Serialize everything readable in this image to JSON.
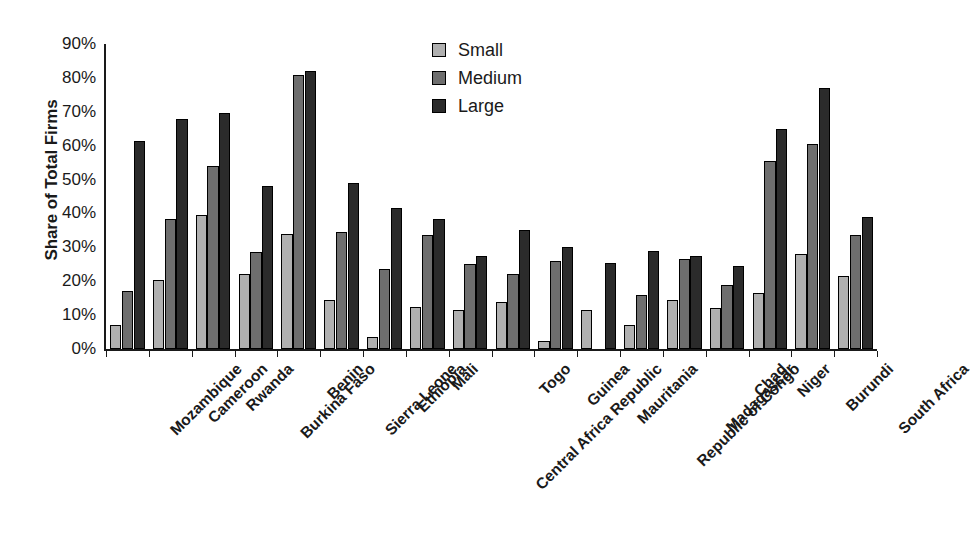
{
  "chart_data": {
    "type": "bar",
    "title": "",
    "subtitle": "",
    "xlabel": "",
    "ylabel": "Share of Total Firms",
    "ylim": [
      0,
      90
    ],
    "ytick_step": 10,
    "ytick_labels": [
      "0%",
      "10%",
      "20%",
      "30%",
      "40%",
      "50%",
      "60%",
      "70%",
      "80%",
      "90%"
    ],
    "ytick_values": [
      0,
      10,
      20,
      30,
      40,
      50,
      60,
      70,
      80,
      90
    ],
    "grid": false,
    "legend_position": "top-center",
    "categories": [
      "Mozambique",
      "Cameroon",
      "Rwanda",
      "Burkina Faso",
      "Benin",
      "Sierra Leone",
      "Ethiopia",
      "Mali",
      "Central Africa Republic",
      "Togo",
      "Guinea",
      "Mauritania",
      "Republic of Congo",
      "Madagascar",
      "Chad",
      "Niger",
      "Burundi",
      "South Africa"
    ],
    "series": [
      {
        "name": "Small",
        "color": "#b0b0b0",
        "values": [
          7,
          20.5,
          39.5,
          22,
          34,
          14.5,
          3.5,
          12.5,
          11.5,
          14,
          2.5,
          11.5,
          7,
          14.5,
          12,
          16.5,
          28,
          21.5
        ]
      },
      {
        "name": "Medium",
        "color": "#6e6e6e",
        "values": [
          17,
          38.5,
          54,
          28.5,
          81,
          34.5,
          23.5,
          33.5,
          25,
          22,
          26,
          0,
          16,
          26.5,
          19,
          55.5,
          60.5,
          33.5
        ]
      },
      {
        "name": "Large",
        "color": "#2b2b2b",
        "values": [
          61.5,
          68,
          69.5,
          48,
          82,
          49,
          41.5,
          38.5,
          27.5,
          35,
          30,
          25.5,
          29,
          27.5,
          24.5,
          65,
          77,
          39
        ]
      }
    ]
  },
  "legend": {
    "items": [
      {
        "label": "Small",
        "key": "small"
      },
      {
        "label": "Medium",
        "key": "medium"
      },
      {
        "label": "Large",
        "key": "large"
      }
    ]
  },
  "colors": {
    "small": "#b0b0b0",
    "medium": "#6e6e6e",
    "large": "#2b2b2b",
    "axis": "#1a1a1a",
    "background": "#ffffff"
  }
}
